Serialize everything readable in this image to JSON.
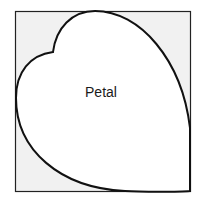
{
  "diagram": {
    "label": "Petal",
    "colors": {
      "background": "#ffffff",
      "box_fill": "#f1f1f1",
      "box_stroke": "#222222",
      "petal_fill": "#ffffff",
      "petal_stroke": "#111111"
    }
  }
}
